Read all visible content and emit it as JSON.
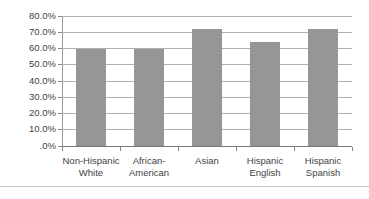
{
  "chart_data": {
    "type": "bar",
    "title": "",
    "subtitle": "",
    "xlabel": "",
    "ylabel": "",
    "categories": [
      "Non-Hispanic White",
      "African-American",
      "Asian",
      "Hispanic English",
      "Hispanic Spanish"
    ],
    "category_lines": [
      [
        "Non-Hispanic",
        "White"
      ],
      [
        "African-",
        "American"
      ],
      [
        "Asian",
        ""
      ],
      [
        "Hispanic",
        "English"
      ],
      [
        "Hispanic",
        "Spanish"
      ]
    ],
    "values": [
      60.0,
      60.0,
      72.0,
      64.0,
      72.0
    ],
    "value_labels": [
      "60.0%",
      "60.0%",
      "72.0%",
      "64.0%",
      "72.0%"
    ],
    "ylim": [
      0,
      80
    ],
    "ytick_values": [
      80,
      70,
      60,
      50,
      40,
      30,
      20,
      10,
      0
    ],
    "ytick_labels": [
      "80.0%",
      "70.0%",
      "60.0%",
      "50.0%",
      "40.0%",
      "30.0%",
      "20.0%",
      "10.0%",
      ".0%"
    ],
    "grid": true,
    "legend": false,
    "legend_position": "none",
    "series_color": "#969696",
    "gridline_color": "#b0b0b0",
    "axis_color": "#8a8a8a",
    "text_color": "#3f3f3f",
    "background_color": "#ffffff"
  }
}
